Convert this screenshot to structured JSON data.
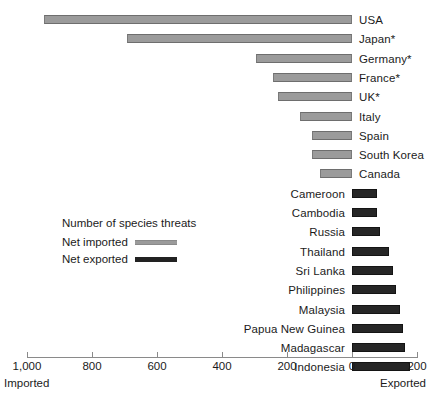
{
  "chart_data": {
    "type": "bar",
    "orientation": "horizontal-diverging",
    "title": "",
    "xlabel": "",
    "ylabel": "",
    "legend_title": "Number of species threats",
    "legend": [
      {
        "label": "Net imported",
        "color": "#9b9b9b",
        "key": "imported"
      },
      {
        "label": "Net exported",
        "color": "#222222",
        "key": "exported"
      }
    ],
    "legend_position": "center-left",
    "grid": false,
    "axis": {
      "tick_labels": [
        "1,000",
        "800",
        "600",
        "400",
        "200",
        "0",
        "200"
      ],
      "tick_values": [
        -1000,
        -800,
        -600,
        -400,
        -200,
        0,
        200
      ],
      "xlim": [
        -1050,
        230
      ],
      "left_end_label": "Imported",
      "right_end_label": "Exported"
    },
    "categories": [
      "USA",
      "Japan*",
      "Germany*",
      "France*",
      "UK*",
      "Italy",
      "Spain",
      "South Korea",
      "Canada",
      "Cameroon",
      "Cambodia",
      "Russia",
      "Thailand",
      "Sri Lanka",
      "Philippines",
      "Malaysia",
      "Papua New Guinea",
      "Madagascar",
      "Indonesia"
    ],
    "values": [
      -948,
      -692,
      -295,
      -243,
      -228,
      -160,
      -123,
      -123,
      -98,
      77,
      77,
      86,
      114,
      126,
      135,
      148,
      157,
      163,
      178
    ],
    "series": [
      {
        "name": "Net imported",
        "key": "imported",
        "color": "#9b9b9b",
        "points": [
          {
            "category": "USA",
            "value": 948
          },
          {
            "category": "Japan*",
            "value": 692
          },
          {
            "category": "Germany*",
            "value": 295
          },
          {
            "category": "France*",
            "value": 243
          },
          {
            "category": "UK*",
            "value": 228
          },
          {
            "category": "Italy",
            "value": 160
          },
          {
            "category": "Spain",
            "value": 123
          },
          {
            "category": "South Korea",
            "value": 123
          },
          {
            "category": "Canada",
            "value": 98
          }
        ]
      },
      {
        "name": "Net exported",
        "key": "exported",
        "color": "#222222",
        "points": [
          {
            "category": "Cameroon",
            "value": 77
          },
          {
            "category": "Cambodia",
            "value": 77
          },
          {
            "category": "Russia",
            "value": 86
          },
          {
            "category": "Thailand",
            "value": 114
          },
          {
            "category": "Sri Lanka",
            "value": 126
          },
          {
            "category": "Philippines",
            "value": 135
          },
          {
            "category": "Malaysia",
            "value": 148
          },
          {
            "category": "Papua New Guinea",
            "value": 157
          },
          {
            "category": "Madagascar",
            "value": 163
          },
          {
            "category": "Indonesia",
            "value": 178
          }
        ]
      }
    ],
    "rows": [
      {
        "label": "USA",
        "series": "imported",
        "value": 948
      },
      {
        "label": "Japan*",
        "series": "imported",
        "value": 692
      },
      {
        "label": "Germany*",
        "series": "imported",
        "value": 295
      },
      {
        "label": "France*",
        "series": "imported",
        "value": 243
      },
      {
        "label": "UK*",
        "series": "imported",
        "value": 228
      },
      {
        "label": "Italy",
        "series": "imported",
        "value": 160
      },
      {
        "label": "Spain",
        "series": "imported",
        "value": 123
      },
      {
        "label": "South Korea",
        "series": "imported",
        "value": 123
      },
      {
        "label": "Canada",
        "series": "imported",
        "value": 98
      },
      {
        "label": "Cameroon",
        "series": "exported",
        "value": 77
      },
      {
        "label": "Cambodia",
        "series": "exported",
        "value": 77
      },
      {
        "label": "Russia",
        "series": "exported",
        "value": 86
      },
      {
        "label": "Thailand",
        "series": "exported",
        "value": 114
      },
      {
        "label": "Sri Lanka",
        "series": "exported",
        "value": 126
      },
      {
        "label": "Philippines",
        "series": "exported",
        "value": 135
      },
      {
        "label": "Malaysia",
        "series": "exported",
        "value": 148
      },
      {
        "label": "Papua New Guinea",
        "series": "exported",
        "value": 157
      },
      {
        "label": "Madagascar",
        "series": "exported",
        "value": 163
      },
      {
        "label": "Indonesia",
        "series": "exported",
        "value": 178
      }
    ]
  }
}
